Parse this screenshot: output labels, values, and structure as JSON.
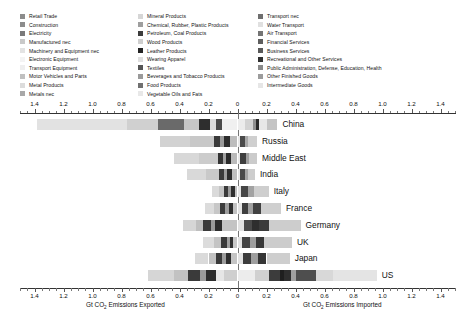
{
  "chart_data": {
    "type": "bar",
    "orientation": "horizontal",
    "layout": "diverging-stacked",
    "title": "",
    "xlabel_left": "Gt CO2 Emissions Exported",
    "xlabel_right": "Gt CO2 Emissions Imported",
    "ylabel": "",
    "xlim": [
      -1.5,
      1.5
    ],
    "grid": false,
    "xticks": [
      -1.4,
      -1.2,
      -1.0,
      -0.8,
      -0.6,
      -0.4,
      -0.2,
      0,
      0.2,
      0.4,
      0.6,
      0.8,
      1.0,
      1.2,
      1.4
    ],
    "xticklabels": [
      "1.4",
      "1.2",
      "1.0",
      "0.8",
      "0.6",
      "0.4",
      "0.2",
      "0",
      "0.2",
      "0.4",
      "0.6",
      "0.8",
      "1.0",
      "1.2",
      "1.4"
    ],
    "categories": [
      "China",
      "Russia",
      "Middle East",
      "India",
      "Italy",
      "France",
      "Germany",
      "UK",
      "Japan",
      "US"
    ],
    "axis_note": "Left side = exports (values shown as positive magnitudes), right side = imports",
    "totals": {
      "exported": [
        1.385,
        0.535,
        0.44,
        0.345,
        0.175,
        0.225,
        0.375,
        0.235,
        0.29,
        0.62
      ],
      "imported": [
        0.275,
        0.135,
        0.135,
        0.12,
        0.215,
        0.3,
        0.435,
        0.375,
        0.36,
        1.16
      ]
    },
    "series": [
      {
        "name": "Retail Trade",
        "color": "#8c8c8c"
      },
      {
        "name": "Construction",
        "color": "#8c8c8c"
      },
      {
        "name": "Electricity",
        "color": "#7a7a7a"
      },
      {
        "name": "Manufactured nec",
        "color": "#c9c9c9"
      },
      {
        "name": "Machinery and Equipment nec",
        "color": "#e3e3e3"
      },
      {
        "name": "Electronic Equipment",
        "color": "#f2f2f2"
      },
      {
        "name": "Transport Equipment",
        "color": "#ededed"
      },
      {
        "name": "Motor Vehicles and Parts",
        "color": "#c0c0c0"
      },
      {
        "name": "Metal Products",
        "color": "#dcdcdc"
      },
      {
        "name": "Metals nec",
        "color": "#a8a8a8"
      },
      {
        "name": "Mineral Products",
        "color": "#d6d6d6"
      },
      {
        "name": "Chemical, Rubber, Plastic Products",
        "color": "#9e9e9e"
      },
      {
        "name": "Petroleum, Coal Products",
        "color": "#3d3d3d"
      },
      {
        "name": "Wood Products",
        "color": "#cfcfcf"
      },
      {
        "name": "Leather Products",
        "color": "#242424"
      },
      {
        "name": "Wearing Apparel",
        "color": "#dedede"
      },
      {
        "name": "Textiles",
        "color": "#555555"
      },
      {
        "name": "Beverages and Tobacco Products",
        "color": "#9a9a9a"
      },
      {
        "name": "Food Products",
        "color": "#707070"
      },
      {
        "name": "Vegetable Oils and Fats",
        "color": "#e8e8e8"
      },
      {
        "name": "Transport nec",
        "color": "#6e6e6e"
      },
      {
        "name": "Water Transport",
        "color": "#e0e0e0"
      },
      {
        "name": "Air Transport",
        "color": "#747474"
      },
      {
        "name": "Financial Services",
        "color": "#5e5e5e"
      },
      {
        "name": "Business Services",
        "color": "#595959"
      },
      {
        "name": "Recreational and Other Services",
        "color": "#303030"
      },
      {
        "name": "Public Administration, Defense, Education, Health",
        "color": "#8a8a8a"
      },
      {
        "name": "Other Finished Goods",
        "color": "#9c9c9c"
      },
      {
        "name": "Intermediate Goods",
        "color": "#e6e6e6"
      }
    ],
    "bars": [
      {
        "category": "China",
        "export_segments": [
          {
            "value": 0.62,
            "color": "#e2e2e2"
          },
          {
            "value": 0.22,
            "color": "#d0d0d0"
          },
          {
            "value": 0.175,
            "color": "#6a6a6a"
          },
          {
            "value": 0.105,
            "color": "#c6c6c6"
          },
          {
            "value": 0.075,
            "color": "#2e2e2e"
          },
          {
            "value": 0.045,
            "color": "#dcdcdc"
          },
          {
            "value": 0.035,
            "color": "#4a4a4a"
          },
          {
            "value": 0.11,
            "color": "#f0f0f0"
          }
        ],
        "import_segments": [
          {
            "value": 0.055,
            "color": "#ececec"
          },
          {
            "value": 0.055,
            "color": "#d3d3d3"
          },
          {
            "value": 0.02,
            "color": "#8f8f8f"
          },
          {
            "value": 0.02,
            "color": "#2a2a2a"
          },
          {
            "value": 0.055,
            "color": "#e8e8e8"
          },
          {
            "value": 0.07,
            "color": "#c4c4c4"
          }
        ]
      },
      {
        "category": "Russia",
        "export_segments": [
          {
            "value": 0.21,
            "color": "#d2d2d2"
          },
          {
            "value": 0.165,
            "color": "#c8c8c8"
          },
          {
            "value": 0.04,
            "color": "#3a3a3a"
          },
          {
            "value": 0.025,
            "color": "#9a9a9a"
          },
          {
            "value": 0.04,
            "color": "#2c2c2c"
          },
          {
            "value": 0.055,
            "color": "#bdbdbd"
          }
        ],
        "import_segments": [
          {
            "value": 0.02,
            "color": "#e6e6e6"
          },
          {
            "value": 0.035,
            "color": "#4a4a4a"
          },
          {
            "value": 0.02,
            "color": "#a8a8a8"
          },
          {
            "value": 0.06,
            "color": "#cfcfcf"
          }
        ]
      },
      {
        "category": "Middle East",
        "export_segments": [
          {
            "value": 0.175,
            "color": "#d8d8d8"
          },
          {
            "value": 0.13,
            "color": "#cccccc"
          },
          {
            "value": 0.035,
            "color": "#343434"
          },
          {
            "value": 0.02,
            "color": "#a0a0a0"
          },
          {
            "value": 0.035,
            "color": "#2a2a2a"
          },
          {
            "value": 0.045,
            "color": "#bababa"
          }
        ],
        "import_segments": [
          {
            "value": 0.02,
            "color": "#e8e8e8"
          },
          {
            "value": 0.04,
            "color": "#3e3e3e"
          },
          {
            "value": 0.02,
            "color": "#9e9e9e"
          },
          {
            "value": 0.055,
            "color": "#cbcbcb"
          }
        ]
      },
      {
        "category": "India",
        "export_segments": [
          {
            "value": 0.125,
            "color": "#d9d9d9"
          },
          {
            "value": 0.09,
            "color": "#c9c9c9"
          },
          {
            "value": 0.035,
            "color": "#3a3a3a"
          },
          {
            "value": 0.02,
            "color": "#9c9c9c"
          },
          {
            "value": 0.035,
            "color": "#2c2c2c"
          },
          {
            "value": 0.04,
            "color": "#bfbfbf"
          }
        ],
        "import_segments": [
          {
            "value": 0.02,
            "color": "#e6e6e6"
          },
          {
            "value": 0.03,
            "color": "#4a4a4a"
          },
          {
            "value": 0.02,
            "color": "#a4a4a4"
          },
          {
            "value": 0.05,
            "color": "#cdcdcd"
          }
        ]
      },
      {
        "category": "Italy",
        "export_segments": [
          {
            "value": 0.045,
            "color": "#dadada"
          },
          {
            "value": 0.035,
            "color": "#c5c5c5"
          },
          {
            "value": 0.03,
            "color": "#3a3a3a"
          },
          {
            "value": 0.02,
            "color": "#9c9c9c"
          },
          {
            "value": 0.025,
            "color": "#2e2e2e"
          },
          {
            "value": 0.02,
            "color": "#c0c0c0"
          }
        ],
        "import_segments": [
          {
            "value": 0.025,
            "color": "#e4e4e4"
          },
          {
            "value": 0.05,
            "color": "#464646"
          },
          {
            "value": 0.04,
            "color": "#a2a2a2"
          },
          {
            "value": 0.1,
            "color": "#cecece"
          }
        ]
      },
      {
        "category": "France",
        "export_segments": [
          {
            "value": 0.06,
            "color": "#dcdcdc"
          },
          {
            "value": 0.045,
            "color": "#c7c7c7"
          },
          {
            "value": 0.035,
            "color": "#3c3c3c"
          },
          {
            "value": 0.025,
            "color": "#9e9e9e"
          },
          {
            "value": 0.03,
            "color": "#303030"
          },
          {
            "value": 0.03,
            "color": "#c2c2c2"
          }
        ],
        "import_segments": [
          {
            "value": 0.03,
            "color": "#e4e4e4"
          },
          {
            "value": 0.045,
            "color": "#3e3e3e"
          },
          {
            "value": 0.035,
            "color": "#a0a0a0"
          },
          {
            "value": 0.05,
            "color": "#414141"
          },
          {
            "value": 0.14,
            "color": "#cfcfcf"
          }
        ]
      },
      {
        "category": "Germany",
        "export_segments": [
          {
            "value": 0.09,
            "color": "#d6d6d6"
          },
          {
            "value": 0.05,
            "color": "#bfbfbf"
          },
          {
            "value": 0.05,
            "color": "#3a3a3a"
          },
          {
            "value": 0.03,
            "color": "#9a9a9a"
          },
          {
            "value": 0.045,
            "color": "#2c2c2c"
          },
          {
            "value": 0.11,
            "color": "#c4c4c4"
          }
        ],
        "import_segments": [
          {
            "value": 0.045,
            "color": "#e2e2e2"
          },
          {
            "value": 0.055,
            "color": "#4a4a4a"
          },
          {
            "value": 0.045,
            "color": "#2e2e2e"
          },
          {
            "value": 0.07,
            "color": "#3a3a3a"
          },
          {
            "value": 0.22,
            "color": "#cdcdcd"
          }
        ]
      },
      {
        "category": "UK",
        "export_segments": [
          {
            "value": 0.075,
            "color": "#dcdcdc"
          },
          {
            "value": 0.045,
            "color": "#c4c4c4"
          },
          {
            "value": 0.04,
            "color": "#3a3a3a"
          },
          {
            "value": 0.02,
            "color": "#a0a0a0"
          },
          {
            "value": 0.025,
            "color": "#303030"
          },
          {
            "value": 0.03,
            "color": "#c6c6c6"
          }
        ],
        "import_segments": [
          {
            "value": 0.03,
            "color": "#e2e2e2"
          },
          {
            "value": 0.055,
            "color": "#444444"
          },
          {
            "value": 0.04,
            "color": "#9e9e9e"
          },
          {
            "value": 0.06,
            "color": "#383838"
          },
          {
            "value": 0.19,
            "color": "#cccccc"
          }
        ]
      },
      {
        "category": "Japan",
        "export_segments": [
          {
            "value": 0.09,
            "color": "#dadada"
          },
          {
            "value": 0.055,
            "color": "#c2c2c2"
          },
          {
            "value": 0.04,
            "color": "#3a3a3a"
          },
          {
            "value": 0.025,
            "color": "#9c9c9c"
          },
          {
            "value": 0.035,
            "color": "#2e2e2e"
          },
          {
            "value": 0.045,
            "color": "#c4c4c4"
          }
        ],
        "import_segments": [
          {
            "value": 0.035,
            "color": "#e2e2e2"
          },
          {
            "value": 0.06,
            "color": "#3c3c3c"
          },
          {
            "value": 0.045,
            "color": "#9e9e9e"
          },
          {
            "value": 0.06,
            "color": "#353535"
          },
          {
            "value": 0.16,
            "color": "#cecece"
          }
        ]
      },
      {
        "category": "US",
        "export_segments": [
          {
            "value": 0.185,
            "color": "#d6d6d6"
          },
          {
            "value": 0.095,
            "color": "#c2c2c2"
          },
          {
            "value": 0.08,
            "color": "#3a3a3a"
          },
          {
            "value": 0.045,
            "color": "#9a9a9a"
          },
          {
            "value": 0.065,
            "color": "#2c2c2c"
          },
          {
            "value": 0.055,
            "color": "#e6e6e6"
          },
          {
            "value": 0.095,
            "color": "#cfcfcf"
          }
        ],
        "import_segments": [
          {
            "value": 0.12,
            "color": "#ececec"
          },
          {
            "value": 0.095,
            "color": "#d0d0d0"
          },
          {
            "value": 0.075,
            "color": "#3c3c3c"
          },
          {
            "value": 0.03,
            "color": "#1f1f1f"
          },
          {
            "value": 0.05,
            "color": "#2e2e2e"
          },
          {
            "value": 0.035,
            "color": "#a0a0a0"
          },
          {
            "value": 0.135,
            "color": "#4e4e4e"
          },
          {
            "value": 0.12,
            "color": "#d8d8d8"
          },
          {
            "value": 0.3,
            "color": "#e4e4e4"
          }
        ]
      }
    ]
  },
  "legend": {
    "columns": [
      {
        "items": [
          {
            "label": "Retail Trade",
            "color": "#8c8c8c"
          },
          {
            "label": "Construction",
            "color": "#8c8c8c"
          },
          {
            "label": "Electricity",
            "color": "#7a7a7a"
          },
          {
            "label": "Manufactured nec",
            "color": "#c9c9c9"
          },
          {
            "label": "Machinery and Equipment nec",
            "color": "#e3e3e3"
          },
          {
            "label": "Electronic Equipment",
            "color": "#f4f4f4"
          },
          {
            "label": "Transport Equipment",
            "color": "#efefef"
          },
          {
            "label": "Motor Vehicles and Parts",
            "color": "#c0c0c0"
          },
          {
            "label": "Metal Products",
            "color": "#dcdcdc"
          },
          {
            "label": "Metals nec",
            "color": "#a8a8a8"
          }
        ]
      },
      {
        "items": [
          {
            "label": "Mineral Products",
            "color": "#d6d6d6"
          },
          {
            "label": "Chemical, Rubber, Plastic Products",
            "color": "#9e9e9e"
          },
          {
            "label": "Petroleum, Coal Products",
            "color": "#3d3d3d"
          },
          {
            "label": "Wood Products",
            "color": "#cfcfcf"
          },
          {
            "label": "Leather Products",
            "color": "#242424"
          },
          {
            "label": "Wearing Apparel",
            "color": "#dedede"
          },
          {
            "label": "Textiles",
            "color": "#555555"
          },
          {
            "label": "Beverages and Tobacco Products",
            "color": "#9a9a9a"
          },
          {
            "label": "Food Products",
            "color": "#707070"
          },
          {
            "label": "Vegetable Oils and Fats",
            "color": "#e8e8e8"
          }
        ]
      },
      {
        "items": [
          {
            "label": "Transport nec",
            "color": "#6e6e6e"
          },
          {
            "label": "Water Transport",
            "color": "#e0e0e0"
          },
          {
            "label": "Air Transport",
            "color": "#747474"
          },
          {
            "label": "Financial Services",
            "color": "#5e5e5e"
          },
          {
            "label": "Business Services",
            "color": "#595959"
          },
          {
            "label": "Recreational and Other Services",
            "color": "#303030"
          },
          {
            "label": "Public Administration, Defense, Education, Health",
            "color": "#8a8a8a"
          },
          {
            "label": "Other Finished Goods",
            "color": "#9c9c9c"
          },
          {
            "label": "Intermediate Goods",
            "color": "#e6e6e6"
          }
        ]
      }
    ]
  }
}
